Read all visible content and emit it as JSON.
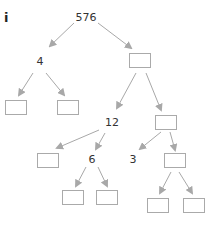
{
  "part_label": "i",
  "tree": {
    "root": "576",
    "nodes": [
      {
        "id": "n576",
        "value": "576",
        "type": "number",
        "x": 86,
        "y": 17
      },
      {
        "id": "n4",
        "value": "4",
        "type": "number",
        "x": 40,
        "y": 61
      },
      {
        "id": "bR1",
        "value": "",
        "type": "box",
        "x": 140,
        "y": 60
      },
      {
        "id": "bLL",
        "value": "",
        "type": "box",
        "x": 16,
        "y": 107
      },
      {
        "id": "bLR",
        "value": "",
        "type": "box",
        "x": 68,
        "y": 107
      },
      {
        "id": "n12",
        "value": "12",
        "type": "number",
        "x": 112,
        "y": 122
      },
      {
        "id": "bR2",
        "value": "",
        "type": "box",
        "x": 166,
        "y": 122
      },
      {
        "id": "b12L",
        "value": "",
        "type": "box",
        "x": 48,
        "y": 160
      },
      {
        "id": "n6",
        "value": "6",
        "type": "number",
        "x": 92,
        "y": 159
      },
      {
        "id": "n3",
        "value": "3",
        "type": "number",
        "x": 133,
        "y": 159
      },
      {
        "id": "bR2R",
        "value": "",
        "type": "box",
        "x": 175,
        "y": 160
      },
      {
        "id": "b6L",
        "value": "",
        "type": "box",
        "x": 73,
        "y": 197
      },
      {
        "id": "b6R",
        "value": "",
        "type": "box",
        "x": 107,
        "y": 197
      },
      {
        "id": "bR3L",
        "value": "",
        "type": "box",
        "x": 158,
        "y": 205
      },
      {
        "id": "bR3R",
        "value": "",
        "type": "box",
        "x": 194,
        "y": 205
      }
    ],
    "edges": [
      {
        "from": "n576",
        "to": "n4",
        "x1": 74,
        "y1": 23,
        "x2": 50,
        "y2": 46
      },
      {
        "from": "n576",
        "to": "bR1",
        "x1": 98,
        "y1": 23,
        "x2": 131,
        "y2": 48
      },
      {
        "from": "n4",
        "to": "bLL",
        "x1": 33,
        "y1": 73,
        "x2": 19,
        "y2": 95
      },
      {
        "from": "n4",
        "to": "bLR",
        "x1": 46,
        "y1": 73,
        "x2": 64,
        "y2": 95
      },
      {
        "from": "bR1",
        "to": "n12",
        "x1": 136,
        "y1": 73,
        "x2": 117,
        "y2": 108
      },
      {
        "from": "bR1",
        "to": "bR2",
        "x1": 146,
        "y1": 73,
        "x2": 161,
        "y2": 110
      },
      {
        "from": "n12",
        "to": "b12L",
        "x1": 99,
        "y1": 130,
        "x2": 57,
        "y2": 148
      },
      {
        "from": "n12",
        "to": "n6",
        "x1": 105,
        "y1": 133,
        "x2": 96,
        "y2": 149
      },
      {
        "from": "bR2",
        "to": "n3",
        "x1": 161,
        "y1": 132,
        "x2": 140,
        "y2": 149
      },
      {
        "from": "bR2",
        "to": "bR2R",
        "x1": 170,
        "y1": 132,
        "x2": 175,
        "y2": 150
      },
      {
        "from": "n6",
        "to": "b6L",
        "x1": 86,
        "y1": 167,
        "x2": 76,
        "y2": 186
      },
      {
        "from": "n6",
        "to": "b6R",
        "x1": 98,
        "y1": 167,
        "x2": 107,
        "y2": 186
      },
      {
        "from": "bR2R",
        "to": "bR3L",
        "x1": 171,
        "y1": 172,
        "x2": 160,
        "y2": 193
      },
      {
        "from": "bR2R",
        "to": "bR3R",
        "x1": 179,
        "y1": 172,
        "x2": 192,
        "y2": 193
      }
    ]
  },
  "colors": {
    "arrow": "#a8a8a8",
    "box_border": "#aaaaaa",
    "text": "#333333"
  }
}
